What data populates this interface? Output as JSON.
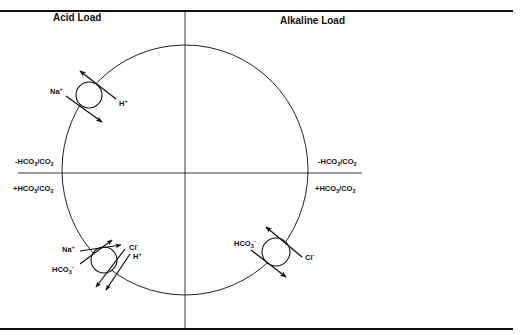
{
  "diagram": {
    "quadrant_titles": {
      "left": "Acid Load",
      "right": "Alkaline Load"
    },
    "axis_labels": {
      "left_upper": {
        "prefix": "-HCO",
        "sub1": "3",
        "mid": "/CO",
        "sub2": "2"
      },
      "left_lower": {
        "prefix": "+HCO",
        "sub1": "3",
        "mid": "/CO",
        "sub2": "2"
      },
      "right_upper": {
        "prefix": "-HCO",
        "sub1": "3",
        "mid": "/CO",
        "sub2": "2"
      },
      "right_lower": {
        "prefix": "+HCO",
        "sub1": "3",
        "mid": "/CO",
        "sub2": "2"
      }
    },
    "exchangers": [
      {
        "name": "sodium-proton-exchanger",
        "quadrant": "acid-load-upper",
        "ions": [
          {
            "base": "Na",
            "charge": "+",
            "direction": "in"
          },
          {
            "base": "H",
            "charge": "+",
            "direction": "out"
          }
        ]
      },
      {
        "name": "sodium-bicarbonate-chloride-proton-exchanger",
        "quadrant": "acid-load-lower",
        "ions": [
          {
            "base": "Na",
            "charge": "+",
            "direction": "in"
          },
          {
            "base": "HCO",
            "sub": "3",
            "charge": "-",
            "direction": "in"
          },
          {
            "base": "Cl",
            "charge": "-",
            "direction": "out"
          },
          {
            "base": "H",
            "charge": "+",
            "direction": "out"
          }
        ]
      },
      {
        "name": "chloride-bicarbonate-exchanger",
        "quadrant": "alkaline-load-lower",
        "ions": [
          {
            "base": "HCO",
            "sub": "3",
            "charge": "-",
            "direction": "out"
          },
          {
            "base": "Cl",
            "charge": "-",
            "direction": "in"
          }
        ]
      }
    ],
    "colors": {
      "ink": "#111111",
      "background": "#ffffff"
    }
  }
}
